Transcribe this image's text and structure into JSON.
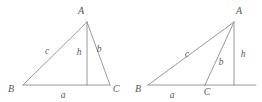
{
  "figure": {
    "background_color": "#ffffff",
    "line_color": "#8d8d8d",
    "label_color": "#585858",
    "figures": [
      {
        "name": "acute-triangle",
        "caption": "Acute triangle with interior altitude h from A to side a",
        "vertices": {
          "A": {
            "x": 87,
            "y": 22,
            "label": "A",
            "label_x": 81,
            "label_y": 14
          },
          "B": {
            "x": 23,
            "y": 85,
            "label": "B",
            "label_x": 11,
            "label_y": 92
          },
          "C": {
            "x": 110,
            "y": 85,
            "label": "C",
            "label_x": 113,
            "label_y": 92
          }
        },
        "altitude_foot": {
          "x": 87,
          "y": 85
        },
        "sides": {
          "a": {
            "label": "a",
            "label_x": 61,
            "label_y": 98
          },
          "b": {
            "label": "b",
            "label_x": 99,
            "label_y": 52
          },
          "c": {
            "label": "c",
            "label_x": 47,
            "label_y": 54
          },
          "h": {
            "label": "h",
            "label_x": 79,
            "label_y": 55
          }
        }
      },
      {
        "name": "obtuse-triangle",
        "caption": "Obtuse triangle with exterior altitude h from A to extension of side a",
        "vertices": {
          "A": {
            "x": 234,
            "y": 22,
            "label": "A",
            "label_x": 236,
            "label_y": 14
          },
          "B": {
            "x": 148,
            "y": 85,
            "label": "B",
            "label_x": 137,
            "label_y": 92
          },
          "C": {
            "x": 205,
            "y": 85,
            "label": "C",
            "label_x": 204,
            "label_y": 95
          }
        },
        "altitude_foot": {
          "x": 234,
          "y": 85
        },
        "baseline_extension_end": {
          "x": 256,
          "y": 85
        },
        "sides": {
          "a": {
            "label": "a",
            "label_x": 170,
            "label_y": 98
          },
          "b": {
            "label": "b",
            "label_x": 221,
            "label_y": 65
          },
          "c": {
            "label": "c",
            "label_x": 187,
            "label_y": 57
          },
          "h": {
            "label": "h",
            "label_x": 242,
            "label_y": 57
          }
        }
      }
    ]
  }
}
